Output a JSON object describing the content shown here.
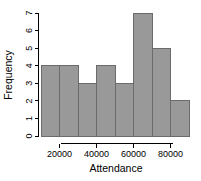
{
  "chart_data": {
    "type": "bar",
    "title": "",
    "subtitle": "",
    "xlabel": "Attendance",
    "ylabel": "Frequency",
    "categories": [
      "10000-20000",
      "20000-30000",
      "30000-40000",
      "40000-50000",
      "50000-60000",
      "60000-70000",
      "70000-80000",
      "80000-90000"
    ],
    "bin_edges": [
      10000,
      20000,
      30000,
      40000,
      50000,
      60000,
      70000,
      80000,
      90000
    ],
    "values": [
      4,
      4,
      3,
      4,
      3,
      7,
      5,
      2
    ],
    "xlim": [
      10000,
      90000
    ],
    "ylim": [
      0,
      7
    ],
    "x_ticks": [
      20000,
      40000,
      60000,
      80000
    ],
    "x_tick_labels": [
      "20000",
      "40000",
      "60000",
      "80000"
    ],
    "y_ticks": [
      0,
      1,
      2,
      3,
      4,
      5,
      6,
      7
    ],
    "y_tick_labels": [
      "0",
      "1",
      "2",
      "3",
      "4",
      "5",
      "6",
      "7"
    ],
    "grid": false,
    "legend": "none",
    "bar_fill_color": "#999999",
    "bar_border_color": "#6b6b6b",
    "axis_color": "#000000",
    "background_color": "#ffffff"
  },
  "axes": {
    "x_title": "Attendance",
    "y_title": "Frequency"
  }
}
